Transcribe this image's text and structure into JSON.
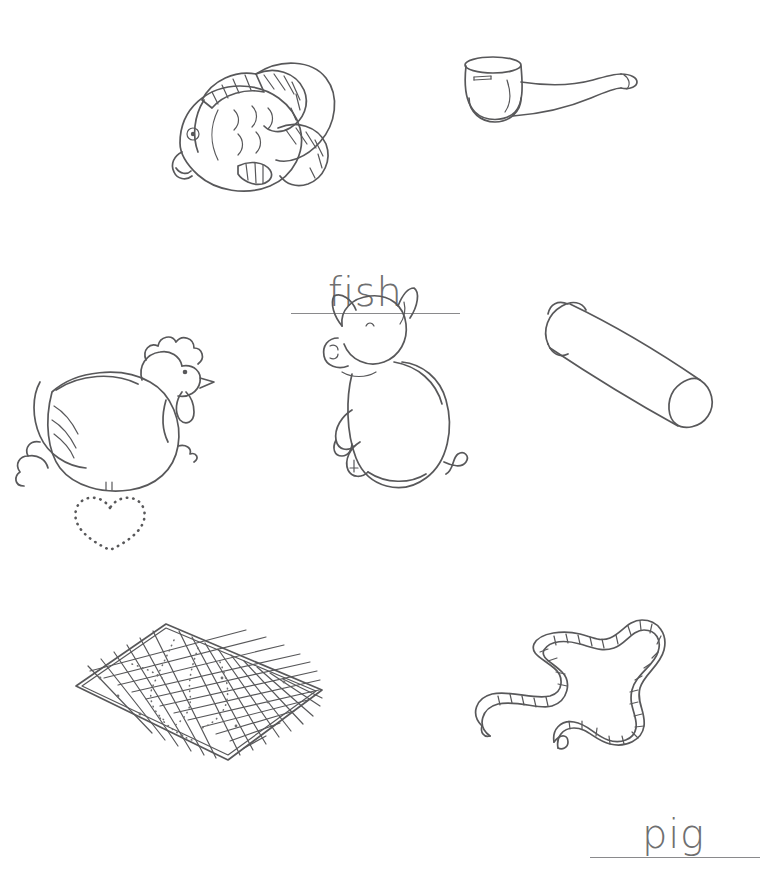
{
  "worksheet": {
    "page_background": "#ffffff",
    "ink_color": "#58585a",
    "text_color": "#6f6f70",
    "rule_color": "#8a8a8c",
    "items": [
      {
        "id": "fish",
        "word": "fish",
        "picture": "fish-illustration",
        "has_writing_rule": true
      },
      {
        "id": "pip",
        "word": "pip",
        "picture": "smoking-pipe-illustration",
        "has_writing_rule": true
      },
      {
        "id": "hen",
        "word": "hen",
        "picture": "hen-illustration",
        "has_writing_rule": true
      },
      {
        "id": "pig",
        "word": "pig",
        "picture": "pig-illustration",
        "has_writing_rule": true
      },
      {
        "id": "tub",
        "word": "tub",
        "picture": "cylinder-tube-illustration",
        "has_writing_rule": true
      },
      {
        "id": "map",
        "word": "map",
        "picture": "grid-map-illustration",
        "has_writing_rule": true
      },
      {
        "id": "tap",
        "word": "tap",
        "picture": "measuring-tape-illustration",
        "has_writing_rule": true
      }
    ]
  }
}
